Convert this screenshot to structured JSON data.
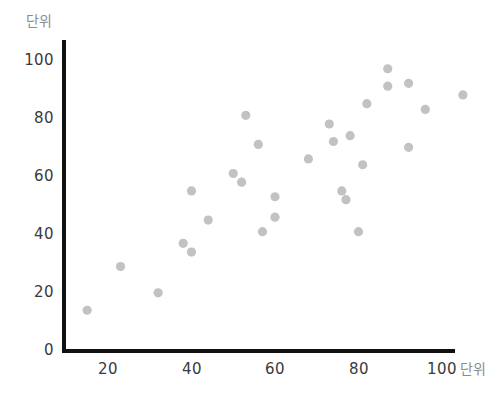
{
  "chart_data": {
    "type": "scatter",
    "title": "",
    "xlabel": "단위",
    "ylabel": "단위",
    "xlim": [
      0,
      110
    ],
    "ylim": [
      0,
      108
    ],
    "xticks": [
      20,
      40,
      60,
      80,
      100
    ],
    "yticks": [
      0,
      20,
      40,
      60,
      80,
      100
    ],
    "grid": false,
    "legend": null,
    "marker_color": "#c2c2c2",
    "axis_color": "#111111",
    "series": [
      {
        "name": "series-1",
        "points": [
          [
            15,
            14
          ],
          [
            23,
            29
          ],
          [
            32,
            20
          ],
          [
            38,
            37
          ],
          [
            40,
            34
          ],
          [
            40,
            55
          ],
          [
            44,
            45
          ],
          [
            50,
            61
          ],
          [
            52,
            58
          ],
          [
            53,
            81
          ],
          [
            56,
            71
          ],
          [
            57,
            41
          ],
          [
            60,
            53
          ],
          [
            60,
            46
          ],
          [
            68,
            66
          ],
          [
            73,
            78
          ],
          [
            74,
            72
          ],
          [
            76,
            55
          ],
          [
            77,
            52
          ],
          [
            78,
            74
          ],
          [
            80,
            41
          ],
          [
            81,
            64
          ],
          [
            82,
            85
          ],
          [
            87,
            97
          ],
          [
            87,
            91
          ],
          [
            92,
            92
          ],
          [
            92,
            70
          ],
          [
            96,
            83
          ],
          [
            105,
            88
          ]
        ]
      }
    ]
  },
  "axes": {
    "y_title": "단위",
    "x_title": "단위",
    "y_tick_labels": [
      "100",
      "80",
      "60",
      "40",
      "20",
      "0"
    ],
    "x_tick_labels": [
      "20",
      "40",
      "60",
      "80",
      "100"
    ]
  }
}
